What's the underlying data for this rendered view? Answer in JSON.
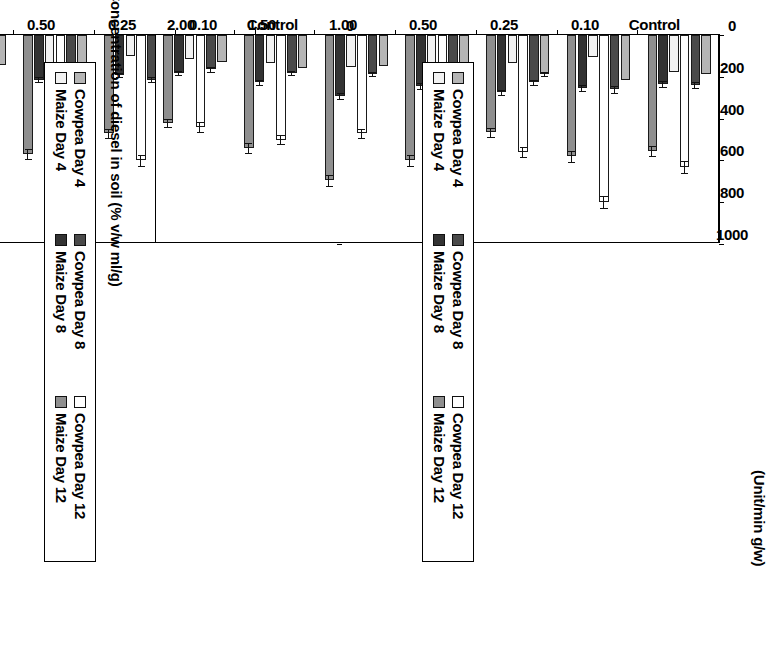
{
  "page": {
    "orientation_note": "rotated-90-clockwise",
    "background": "#ffffff"
  },
  "titles": {
    "left_chart_title": "",
    "right_chart_title": "(Unit/min g/w)"
  },
  "axis": {
    "value_title": "",
    "category_title": "Concentration of diesel in soil (% v/w ml/g)",
    "value_ticks": [
      "0",
      "200",
      "400",
      "600",
      "800",
      "1000"
    ],
    "value_tick_numbers": [
      0,
      200,
      400,
      600,
      800,
      1000
    ],
    "categories": [
      "Control",
      "0.10",
      "0.25",
      "0.50",
      "1.00",
      "1.50",
      "2.00"
    ]
  },
  "legend": {
    "items": [
      {
        "label": "Cowpea Day 4",
        "color": "#b5b5b5"
      },
      {
        "label": "Cowpea Day 8",
        "color": "#4a4a4a"
      },
      {
        "label": "Cowpea Day 12",
        "color": "#ffffff"
      },
      {
        "label": "Maize Day 4",
        "color": "#f2f2f2"
      },
      {
        "label": "Maize Day 8",
        "color": "#333333"
      },
      {
        "label": "Maize Day 12",
        "color": "#8f8f8f"
      }
    ]
  },
  "chart_data": [
    {
      "id": "left-chart",
      "type": "bar",
      "orientation": "horizontal",
      "title": "",
      "xlabel": "Concentration of diesel in soil (% v/w ml/g)",
      "ylabel": "",
      "ylim": [
        0,
        1000
      ],
      "grid": false,
      "legend_position": "right",
      "categories": [
        "Control",
        "0.10",
        "0.25",
        "0.50",
        "1.00",
        "1.50",
        "2.00"
      ],
      "series": [
        {
          "name": "Cowpea Day 4",
          "color": "#b5b5b5",
          "values": [
            175,
            200,
            170,
            190,
            145,
            150,
            130
          ],
          "errors": [
            0,
            0,
            0,
            0,
            0,
            0,
            0
          ]
        },
        {
          "name": "Cowpea Day 8",
          "color": "#4a4a4a",
          "values": [
            225,
            255,
            215,
            215,
            195,
            150,
            150
          ],
          "errors": [
            15,
            18,
            12,
            12,
            10,
            8,
            10
          ]
        },
        {
          "name": "Cowpea Day 12",
          "color": "#ffffff",
          "values": [
            660,
            890,
            600,
            605,
            470,
            415,
            400
          ],
          "errors": [
            28,
            32,
            26,
            26,
            22,
            22,
            20
          ]
        },
        {
          "name": "Maize Day 4",
          "color": "#f2f2f2",
          "values": [
            165,
            90,
            100,
            165,
            155,
            125,
            120
          ],
          "errors": [
            0,
            0,
            0,
            0,
            0,
            0,
            0
          ]
        },
        {
          "name": "Maize Day 8",
          "color": "#333333",
          "values": [
            220,
            250,
            190,
            215,
            260,
            190,
            175
          ],
          "errors": [
            12,
            14,
            10,
            12,
            14,
            10,
            10
          ]
        },
        {
          "name": "Maize Day 12",
          "color": "#8f8f8f",
          "values": [
            545,
            655,
            470,
            570,
            665,
            540,
            415
          ],
          "errors": [
            26,
            26,
            22,
            24,
            26,
            24,
            20
          ]
        }
      ]
    },
    {
      "id": "right-chart",
      "type": "bar",
      "orientation": "horizontal",
      "title": "(Unit/min g/w)",
      "xlabel": "Concentration of diesel in soil (% v/w ml/g)",
      "ylabel": "",
      "ylim": [
        0,
        1000
      ],
      "grid": false,
      "legend_position": "right",
      "categories": [
        "Control",
        "0.10",
        "0.25",
        "0.50",
        "1.00",
        "1.50",
        "2.00"
      ],
      "series": [
        {
          "name": "Cowpea Day 4",
          "color": "#b5b5b5",
          "values": [
            185,
            215,
            185,
            190,
            150,
            160,
            130
          ],
          "errors": [
            0,
            0,
            10,
            0,
            0,
            0,
            0
          ]
        },
        {
          "name": "Cowpea Day 8",
          "color": "#4a4a4a",
          "values": [
            240,
            260,
            225,
            230,
            185,
            180,
            165
          ],
          "errors": [
            15,
            16,
            12,
            14,
            10,
            10,
            10
          ]
        },
        {
          "name": "Cowpea Day 12",
          "color": "#ffffff",
          "values": [
            630,
            800,
            560,
            660,
            470,
            500,
            440
          ],
          "errors": [
            28,
            30,
            24,
            28,
            22,
            22,
            22
          ]
        },
        {
          "name": "Maize Day 4",
          "color": "#f2f2f2",
          "values": [
            175,
            105,
            135,
            180,
            155,
            135,
            115
          ],
          "errors": [
            0,
            0,
            0,
            0,
            0,
            0,
            0
          ]
        },
        {
          "name": "Maize Day 8",
          "color": "#333333",
          "values": [
            235,
            255,
            275,
            245,
            290,
            225,
            180
          ],
          "errors": [
            14,
            14,
            12,
            14,
            14,
            12,
            10
          ]
        },
        {
          "name": "Maize Day 12",
          "color": "#8f8f8f",
          "values": [
            555,
            580,
            465,
            600,
            695,
            540,
            420
          ],
          "errors": [
            26,
            26,
            22,
            26,
            26,
            24,
            20
          ]
        }
      ]
    }
  ]
}
